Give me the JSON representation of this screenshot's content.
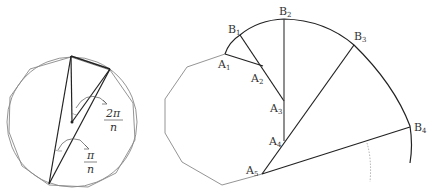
{
  "figure": {
    "left": {
      "title": "Regular polygon inscribed in circle with central and inscribed angles",
      "angle_labels": {
        "central": {
          "num": "2π",
          "den": "n"
        },
        "inscribed": {
          "num": "π",
          "den": "n"
        }
      }
    },
    "right": {
      "title": "Polygon unrolling construction",
      "points": {
        "A": [
          "A",
          "A",
          "A",
          "A",
          "A"
        ],
        "A_sub": [
          "1",
          "2",
          "3",
          "4",
          "5"
        ],
        "B": [
          "B",
          "B",
          "B",
          "B"
        ],
        "B_sub": [
          "1",
          "2",
          "3",
          "4"
        ]
      }
    },
    "colors": {
      "stroke_dark": "#222222",
      "stroke_light": "#888888",
      "text": "#333333"
    }
  }
}
